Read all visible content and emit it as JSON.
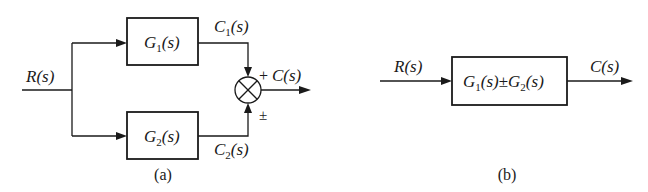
{
  "diagram_a": {
    "caption": "(a)",
    "input_label": "R(s)",
    "blocks": [
      {
        "id": "G1",
        "label_main": "G",
        "label_sub": "1",
        "label_tail": "(s)"
      },
      {
        "id": "G2",
        "label_main": "G",
        "label_sub": "2",
        "label_tail": "(s)"
      }
    ],
    "signals": {
      "c1": {
        "main": "C",
        "sub": "1",
        "tail": "(s)"
      },
      "c2": {
        "main": "C",
        "sub": "2",
        "tail": "(s)"
      }
    },
    "summing_junction": {
      "top_sign": "+",
      "bottom_sign": "±"
    },
    "output_label": "C(s)"
  },
  "diagram_b": {
    "caption": "(b)",
    "input_label": "R(s)",
    "block": {
      "g1_main": "G",
      "g1_sub": "1",
      "g1_tail": "(s)",
      "op": "±",
      "g2_main": "G",
      "g2_sub": "2",
      "g2_tail": "(s)"
    },
    "output_label": "C(s)"
  },
  "colors": {
    "stroke": "#1a1a1a",
    "background": "#ffffff"
  }
}
